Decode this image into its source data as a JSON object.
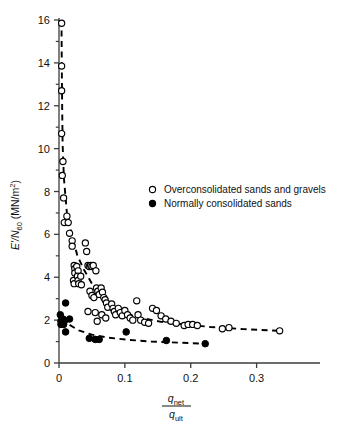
{
  "chart_data": {
    "type": "scatter",
    "title": "",
    "subtitle": "",
    "xlabel_numerator": "q",
    "xlabel_numerator_sub": "net",
    "xlabel_denominator": "q",
    "xlabel_denominator_sub": "ult",
    "ylabel_main": "E'/N",
    "ylabel_sub": "60",
    "ylabel_units": " (MN/m",
    "ylabel_units_sup": "2",
    "ylabel_units_close": ")",
    "ylabel_full": "E'/N60 (MN/m2)",
    "xlabel_full": "q net / q ult",
    "xlim": [
      0,
      0.375
    ],
    "ylim": [
      0,
      16
    ],
    "xticks": [
      0,
      0.1,
      0.2,
      0.3
    ],
    "xtick_labels": [
      "0",
      "0.1",
      "0.2",
      "0.3"
    ],
    "yticks": [
      0,
      2,
      4,
      6,
      8,
      10,
      12,
      14,
      16
    ],
    "ytick_labels": [
      "0",
      "2",
      "4",
      "6",
      "8",
      "10",
      "12",
      "14",
      "16"
    ],
    "yminorticks": [
      1,
      3,
      5,
      7,
      9,
      11,
      13,
      15
    ],
    "grid": false,
    "legend_position": "upper-right-inside",
    "series": [
      {
        "name": "Overconsolidated sands and gravels",
        "marker": "open-circle",
        "color": "#000000",
        "points": [
          [
            0.004,
            15.85
          ],
          [
            0.004,
            13.85
          ],
          [
            0.004,
            12.7
          ],
          [
            0.004,
            10.7
          ],
          [
            0.006,
            9.4
          ],
          [
            0.005,
            8.75
          ],
          [
            0.007,
            7.7
          ],
          [
            0.008,
            6.55
          ],
          [
            0.012,
            6.85
          ],
          [
            0.014,
            6.55
          ],
          [
            0.016,
            6.05
          ],
          [
            0.02,
            5.7
          ],
          [
            0.02,
            5.45
          ],
          [
            0.023,
            4.55
          ],
          [
            0.024,
            4.4
          ],
          [
            0.024,
            4.2
          ],
          [
            0.022,
            3.85
          ],
          [
            0.023,
            3.7
          ],
          [
            0.027,
            4.5
          ],
          [
            0.029,
            4.3
          ],
          [
            0.028,
            4.05
          ],
          [
            0.029,
            3.85
          ],
          [
            0.03,
            3.7
          ],
          [
            0.033,
            4.05
          ],
          [
            0.034,
            3.65
          ],
          [
            0.04,
            5.6
          ],
          [
            0.042,
            5.2
          ],
          [
            0.044,
            4.55
          ],
          [
            0.046,
            4.5
          ],
          [
            0.048,
            4.55
          ],
          [
            0.05,
            4.5
          ],
          [
            0.052,
            4.55
          ],
          [
            0.047,
            3.35
          ],
          [
            0.05,
            3.15
          ],
          [
            0.053,
            3.05
          ],
          [
            0.044,
            2.4
          ],
          [
            0.056,
            4.3
          ],
          [
            0.057,
            3.5
          ],
          [
            0.059,
            3.35
          ],
          [
            0.061,
            3.2
          ],
          [
            0.055,
            2.35
          ],
          [
            0.058,
            1.95
          ],
          [
            0.064,
            3.5
          ],
          [
            0.066,
            3.3
          ],
          [
            0.068,
            3.05
          ],
          [
            0.065,
            2.25
          ],
          [
            0.07,
            2.95
          ],
          [
            0.072,
            2.8
          ],
          [
            0.074,
            2.6
          ],
          [
            0.071,
            2.1
          ],
          [
            0.08,
            2.75
          ],
          [
            0.082,
            2.55
          ],
          [
            0.084,
            2.4
          ],
          [
            0.086,
            2.25
          ],
          [
            0.09,
            2.55
          ],
          [
            0.093,
            2.35
          ],
          [
            0.096,
            2.2
          ],
          [
            0.1,
            2.45
          ],
          [
            0.104,
            2.25
          ],
          [
            0.108,
            2.1
          ],
          [
            0.112,
            2.0
          ],
          [
            0.118,
            2.9
          ],
          [
            0.12,
            2.25
          ],
          [
            0.124,
            2.0
          ],
          [
            0.13,
            1.9
          ],
          [
            0.136,
            1.85
          ],
          [
            0.142,
            2.55
          ],
          [
            0.148,
            2.45
          ],
          [
            0.155,
            2.2
          ],
          [
            0.162,
            2.05
          ],
          [
            0.17,
            1.95
          ],
          [
            0.178,
            1.85
          ],
          [
            0.19,
            1.75
          ],
          [
            0.196,
            1.8
          ],
          [
            0.203,
            1.8
          ],
          [
            0.21,
            1.75
          ],
          [
            0.248,
            1.6
          ],
          [
            0.258,
            1.65
          ],
          [
            0.335,
            1.5
          ]
        ]
      },
      {
        "name": "Normally consolidated sands",
        "marker": "filled-circle",
        "color": "#000000",
        "points": [
          [
            0.002,
            2.25
          ],
          [
            0.003,
            1.95
          ],
          [
            0.003,
            1.8
          ],
          [
            0.006,
            2.05
          ],
          [
            0.007,
            1.8
          ],
          [
            0.008,
            1.95
          ],
          [
            0.01,
            2.8
          ],
          [
            0.01,
            1.45
          ],
          [
            0.016,
            2.05
          ],
          [
            0.046,
            1.15
          ],
          [
            0.055,
            1.1
          ],
          [
            0.061,
            1.1
          ],
          [
            0.102,
            1.45
          ],
          [
            0.163,
            1.05
          ],
          [
            0.222,
            0.9
          ]
        ]
      }
    ],
    "trend_curves": [
      {
        "name": "overconsolidated-trend",
        "style": "dashed",
        "points": [
          [
            0.0038,
            16.0
          ],
          [
            0.0042,
            14.0
          ],
          [
            0.0048,
            12.0
          ],
          [
            0.0055,
            10.2
          ],
          [
            0.0075,
            8.6
          ],
          [
            0.012,
            7.0
          ],
          [
            0.02,
            5.9
          ],
          [
            0.028,
            5.0
          ],
          [
            0.038,
            4.35
          ],
          [
            0.05,
            3.7
          ],
          [
            0.065,
            3.1
          ],
          [
            0.082,
            2.65
          ],
          [
            0.1,
            2.35
          ],
          [
            0.125,
            2.1
          ],
          [
            0.155,
            1.92
          ],
          [
            0.19,
            1.8
          ],
          [
            0.23,
            1.68
          ],
          [
            0.28,
            1.58
          ],
          [
            0.335,
            1.5
          ]
        ]
      },
      {
        "name": "normally-consolidated-trend",
        "style": "dashed",
        "points": [
          [
            0.004,
            2.1
          ],
          [
            0.015,
            1.8
          ],
          [
            0.03,
            1.52
          ],
          [
            0.05,
            1.32
          ],
          [
            0.075,
            1.18
          ],
          [
            0.105,
            1.08
          ],
          [
            0.14,
            1.0
          ],
          [
            0.18,
            0.95
          ],
          [
            0.222,
            0.9
          ]
        ]
      }
    ],
    "legend": [
      {
        "marker": "open-circle",
        "label": "Overconsolidated sands and gravels"
      },
      {
        "marker": "filled-circle",
        "label": "Normally consolidated sands"
      }
    ],
    "colors": {
      "axis": "#3b3b3b",
      "marker": "#000000",
      "curve": "#000000",
      "background": "#ffffff"
    }
  }
}
